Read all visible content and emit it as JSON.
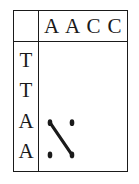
{
  "figure": {
    "kind": "dot-plot-alignment-matrix",
    "background_color": "#ffffff",
    "line_color": "#1a1a1a",
    "border_color": "#1a1a1a"
  },
  "column_header": {
    "sequence_name": "",
    "letters": [
      "A",
      "A",
      "C",
      "C"
    ]
  },
  "row_header": {
    "sequence_name": "",
    "letters": [
      "T",
      "T",
      "A",
      "A"
    ]
  },
  "chart_data": {
    "type": "scatter",
    "title": "",
    "xlabel": "",
    "ylabel": "",
    "grid": false,
    "legend": null,
    "x_tick_labels": [
      "A",
      "A",
      "C",
      "C"
    ],
    "y_tick_labels": [
      "T",
      "T",
      "A",
      "A"
    ],
    "xlim": [
      0,
      4
    ],
    "ylim": [
      0,
      4
    ],
    "points": [
      {
        "col": 0,
        "row": 2,
        "col_letter": "A",
        "row_letter": "A"
      },
      {
        "col": 1,
        "row": 2,
        "col_letter": "A",
        "row_letter": "A"
      },
      {
        "col": 0,
        "row": 3,
        "col_letter": "A",
        "row_letter": "A"
      },
      {
        "col": 1,
        "row": 3,
        "col_letter": "A",
        "row_letter": "A"
      }
    ],
    "annotations": [
      {
        "kind": "diagonal-match-line",
        "from": {
          "col": 0,
          "row": 2
        },
        "to": {
          "col": 1,
          "row": 3
        }
      }
    ]
  }
}
